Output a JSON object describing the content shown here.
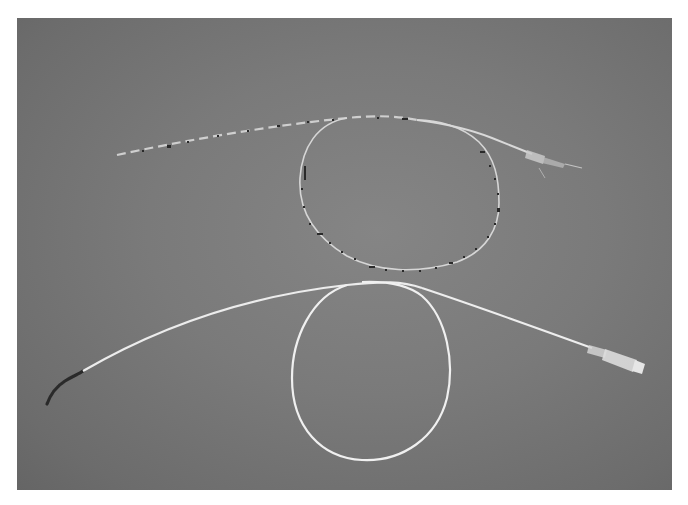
{
  "image": {
    "description": "Photograph of two catheters laid on a grey background",
    "background_color": "#777777",
    "frame_color": "#ffffff"
  },
  "objects": [
    {
      "name": "upper-catheter",
      "label": "Graduated catheter with black depth markings, looped once, with clear luer hub at right",
      "tube_color": "#d8d8d8",
      "marking_color": "#2a2a2a"
    },
    {
      "name": "lower-catheter",
      "label": "White catheter looped once, with dark angled tip at left and clear luer hub at right",
      "tube_color": "#f2f2f2",
      "tip_color": "#2b2b2b"
    }
  ]
}
